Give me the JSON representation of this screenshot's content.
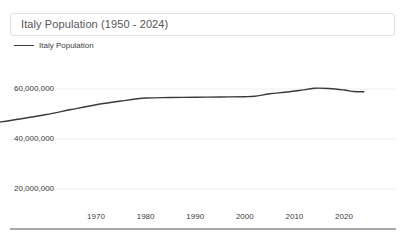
{
  "chart_data": {
    "type": "line",
    "title": "Italy Population (1950 - 2024)",
    "xlabel": "",
    "ylabel": "",
    "legend": [
      {
        "name": "Italy Population",
        "color": "#3a3a3a"
      }
    ],
    "legend_position": "top-left",
    "grid": true,
    "xlim": [
      1950,
      2024
    ],
    "ylim": [
      0,
      68000000
    ],
    "xticks": [
      1970,
      1980,
      1990,
      2000,
      2010,
      2020
    ],
    "xticklabels": [
      "1970",
      "1980",
      "1990",
      "2000",
      "2010",
      "2020"
    ],
    "yticks": [
      20000000,
      40000000,
      60000000
    ],
    "yticklabels": [
      "20,000,000",
      "40,000,000",
      "60,000,000"
    ],
    "series": [
      {
        "name": "Italy Population",
        "color": "#3a3a3a",
        "x": [
          1950,
          1955,
          1960,
          1965,
          1970,
          1975,
          1980,
          1985,
          1990,
          1995,
          2000,
          2002,
          2005,
          2008,
          2011,
          2014,
          2017,
          2020,
          2022,
          2024
        ],
        "values": [
          46600000,
          48100000,
          49800000,
          51800000,
          53700000,
          55200000,
          56400000,
          56600000,
          56700000,
          56800000,
          56900000,
          57100000,
          58100000,
          58700000,
          59400000,
          60300000,
          60200000,
          59600000,
          59000000,
          58900000
        ]
      }
    ]
  },
  "axis": {
    "baseline_color": "#555555",
    "gridline_color": "#f0f0f0"
  }
}
